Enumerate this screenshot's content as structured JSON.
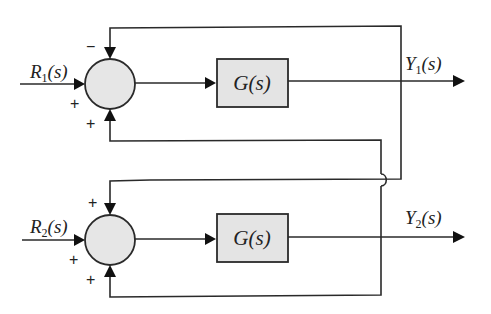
{
  "diagram": {
    "title": "",
    "inputs": [
      {
        "base": "R",
        "sub": "1",
        "arg": "(s)"
      },
      {
        "base": "R",
        "sub": "2",
        "arg": "(s)"
      }
    ],
    "outputs": [
      {
        "base": "Y",
        "sub": "1",
        "arg": "(s)"
      },
      {
        "base": "Y",
        "sub": "2",
        "arg": "(s)"
      }
    ],
    "blocks": [
      {
        "label": "G(s)"
      },
      {
        "label": "G(s)"
      }
    ],
    "junctions": [
      {
        "signs": {
          "top": "−",
          "left": "+",
          "bottom": "+"
        }
      },
      {
        "signs": {
          "top": "+",
          "left": "+",
          "bottom": "+"
        }
      }
    ],
    "connections": [
      "R1(s) → Σ1 (+)",
      "Σ1 → G(s) → Y1(s)",
      "Y1(s) → Σ1 top (−)",
      "Y1(s) → Σ2 top (+)",
      "Y2(s) → Σ1 bottom (+)",
      "R2(s) → Σ2 (+)",
      "Σ2 → G(s) → Y2(s)",
      "Y2(s) → Σ2 bottom (+)"
    ],
    "colors": {
      "line": "#2a2a2a",
      "block_fill": "#e4e4e4",
      "junction_fill": "#e6e6e6",
      "background": "#ffffff"
    }
  }
}
